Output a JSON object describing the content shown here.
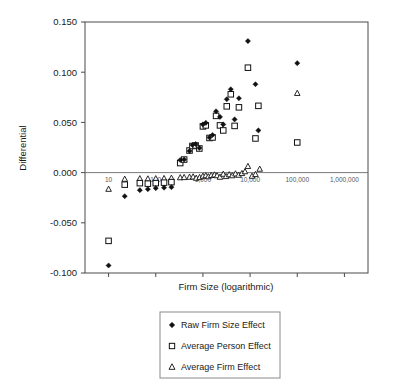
{
  "chart_data": {
    "type": "scatter",
    "title": "",
    "xlabel": "Firm Size (logarithmic)",
    "ylabel": "Differential",
    "xscale": "log",
    "xlim": [
      3.1622776601683795,
      3162277.6601683795
    ],
    "ylim": [
      -0.1,
      0.15
    ],
    "ytick_labels": [
      "0.150",
      "0.100",
      "0.050",
      "0.000",
      "-0.050",
      "-0.100"
    ],
    "ytick_values": [
      0.15,
      0.1,
      0.05,
      0.0,
      -0.05,
      -0.1
    ],
    "xtick_labels": [
      "10",
      "100",
      "1,000",
      "10,000",
      "100,000",
      "1,000,000"
    ],
    "xtick_values": [
      10,
      100,
      1000,
      10000,
      100000,
      1000000
    ],
    "grid": false,
    "legend_position": "below-plot",
    "series": [
      {
        "name": "Raw Firm Size Effect",
        "marker": "filled-diamond",
        "color": "#111111",
        "points": [
          [
            10,
            -0.0925
          ],
          [
            22,
            -0.0235
          ],
          [
            46,
            -0.0175
          ],
          [
            68,
            -0.0165
          ],
          [
            100,
            -0.0155
          ],
          [
            150,
            -0.015
          ],
          [
            215,
            -0.0145
          ],
          [
            330,
            0.0125
          ],
          [
            400,
            0.013
          ],
          [
            520,
            0.0215
          ],
          [
            600,
            0.0275
          ],
          [
            700,
            0.0285
          ],
          [
            840,
            0.0245
          ],
          [
            1000,
            0.048
          ],
          [
            1150,
            0.0495
          ],
          [
            1380,
            0.035
          ],
          [
            1600,
            0.0375
          ],
          [
            1900,
            0.061
          ],
          [
            2300,
            0.0555
          ],
          [
            2700,
            0.048
          ],
          [
            3200,
            0.073
          ],
          [
            3900,
            0.083
          ],
          [
            4700,
            0.053
          ],
          [
            5800,
            0.074
          ],
          [
            9000,
            0.131
          ],
          [
            13000,
            0.088
          ],
          [
            15000,
            0.042
          ],
          [
            100000,
            0.109
          ]
        ]
      },
      {
        "name": "Average Person Effect",
        "marker": "open-square",
        "color": "#111111",
        "points": [
          [
            10,
            -0.068
          ],
          [
            22,
            -0.012
          ],
          [
            46,
            -0.0105
          ],
          [
            68,
            -0.011
          ],
          [
            100,
            -0.0105
          ],
          [
            150,
            -0.01
          ],
          [
            215,
            -0.0095
          ],
          [
            330,
            0.0095
          ],
          [
            400,
            0.013
          ],
          [
            520,
            0.022
          ],
          [
            600,
            0.0265
          ],
          [
            700,
            0.027
          ],
          [
            840,
            0.024
          ],
          [
            1000,
            0.046
          ],
          [
            1150,
            0.047
          ],
          [
            1380,
            0.0345
          ],
          [
            1600,
            0.035
          ],
          [
            1900,
            0.0565
          ],
          [
            2300,
            0.047
          ],
          [
            2700,
            0.042
          ],
          [
            3200,
            0.066
          ],
          [
            3900,
            0.078
          ],
          [
            4700,
            0.0465
          ],
          [
            5800,
            0.065
          ],
          [
            9000,
            0.1045
          ],
          [
            13000,
            0.034
          ],
          [
            15000,
            0.0665
          ],
          [
            100000,
            0.03
          ]
        ]
      },
      {
        "name": "Average Firm Effect",
        "marker": "open-triangle",
        "color": "#111111",
        "points": [
          [
            10,
            -0.0165
          ],
          [
            22,
            -0.0065
          ],
          [
            46,
            -0.006
          ],
          [
            68,
            -0.0062
          ],
          [
            100,
            -0.006
          ],
          [
            150,
            -0.0058
          ],
          [
            215,
            -0.0055
          ],
          [
            330,
            -0.005
          ],
          [
            400,
            -0.0048
          ],
          [
            520,
            -0.0045
          ],
          [
            620,
            -0.0042
          ],
          [
            720,
            -0.0055
          ],
          [
            850,
            -0.0048
          ],
          [
            1000,
            -0.0035
          ],
          [
            1150,
            -0.003
          ],
          [
            1300,
            -0.004
          ],
          [
            1500,
            -0.0028
          ],
          [
            1750,
            -0.0022
          ],
          [
            2000,
            -0.003
          ],
          [
            2300,
            -0.0045
          ],
          [
            2700,
            -0.0015
          ],
          [
            3100,
            -0.0038
          ],
          [
            3600,
            -0.002
          ],
          [
            4200,
            -0.003
          ],
          [
            4900,
            -0.0012
          ],
          [
            5700,
            -0.0025
          ],
          [
            6700,
            -0.0008
          ],
          [
            7800,
            0.001
          ],
          [
            9000,
            0.0062
          ],
          [
            11000,
            -0.0035
          ],
          [
            13000,
            -0.0018
          ],
          [
            16000,
            0.0035
          ],
          [
            100000,
            0.079
          ]
        ]
      }
    ]
  },
  "legend": {
    "items": [
      {
        "label": "Raw Firm Size Effect",
        "marker": "filled-diamond"
      },
      {
        "label": "Average Person Effect",
        "marker": "open-square"
      },
      {
        "label": "Average Firm Effect",
        "marker": "open-triangle"
      }
    ]
  }
}
